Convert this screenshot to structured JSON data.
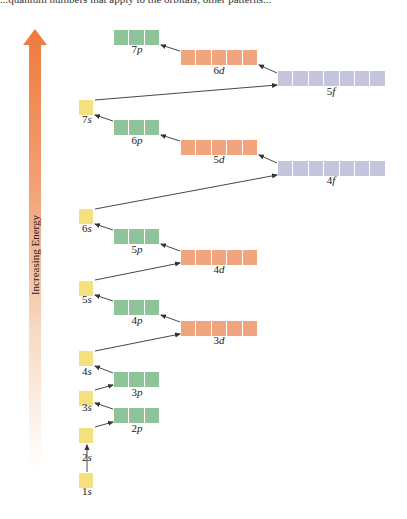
{
  "header": {
    "cutoff_text": "...quantum numbers that apply to the orbitals; other patterns..."
  },
  "axis": {
    "label": "Increasing Energy",
    "gradient_top": "#ee7a3c",
    "gradient_bottom": "#ffffff"
  },
  "colors": {
    "s": "#f4e07e",
    "p": "#8fc49b",
    "d": "#f2a47f",
    "f": "#c5c5dd",
    "arrow": "#333333"
  },
  "orbitals": [
    {
      "id": "1s",
      "n": "1",
      "l": "s",
      "boxes": 1,
      "x": 79,
      "y": 473,
      "label_x": 87,
      "label_y": 491
    },
    {
      "id": "2s",
      "n": "2",
      "l": "s",
      "boxes": 1,
      "x": 79,
      "y": 428,
      "label_x": 87,
      "label_y": 457
    },
    {
      "id": "2p",
      "n": "2",
      "l": "p",
      "boxes": 3,
      "x": 114,
      "y": 408,
      "label_x": 137,
      "label_y": 428
    },
    {
      "id": "3s",
      "n": "3",
      "l": "s",
      "boxes": 1,
      "x": 79,
      "y": 391,
      "label_x": 87,
      "label_y": 407
    },
    {
      "id": "3p",
      "n": "3",
      "l": "p",
      "boxes": 3,
      "x": 114,
      "y": 372,
      "label_x": 137,
      "label_y": 392
    },
    {
      "id": "4s",
      "n": "4",
      "l": "s",
      "boxes": 1,
      "x": 79,
      "y": 351,
      "label_x": 87,
      "label_y": 371
    },
    {
      "id": "3d",
      "n": "3",
      "l": "d",
      "boxes": 5,
      "x": 181,
      "y": 321,
      "label_x": 219,
      "label_y": 340
    },
    {
      "id": "4p",
      "n": "4",
      "l": "p",
      "boxes": 3,
      "x": 114,
      "y": 300,
      "label_x": 137,
      "label_y": 320
    },
    {
      "id": "5s",
      "n": "5",
      "l": "s",
      "boxes": 1,
      "x": 79,
      "y": 281,
      "label_x": 87,
      "label_y": 299
    },
    {
      "id": "4d",
      "n": "4",
      "l": "d",
      "boxes": 5,
      "x": 181,
      "y": 250,
      "label_x": 219,
      "label_y": 269
    },
    {
      "id": "5p",
      "n": "5",
      "l": "p",
      "boxes": 3,
      "x": 114,
      "y": 229,
      "label_x": 137,
      "label_y": 249
    },
    {
      "id": "6s",
      "n": "6",
      "l": "s",
      "boxes": 1,
      "x": 79,
      "y": 209,
      "label_x": 87,
      "label_y": 228
    },
    {
      "id": "4f",
      "n": "4",
      "l": "f",
      "boxes": 7,
      "x": 278,
      "y": 161,
      "label_x": 331,
      "label_y": 180
    },
    {
      "id": "5d",
      "n": "5",
      "l": "d",
      "boxes": 5,
      "x": 181,
      "y": 140,
      "label_x": 219,
      "label_y": 159
    },
    {
      "id": "6p",
      "n": "6",
      "l": "p",
      "boxes": 3,
      "x": 114,
      "y": 120,
      "label_x": 137,
      "label_y": 140
    },
    {
      "id": "7s",
      "n": "7",
      "l": "s",
      "boxes": 1,
      "x": 79,
      "y": 100,
      "label_x": 87,
      "label_y": 119
    },
    {
      "id": "5f",
      "n": "5",
      "l": "f",
      "boxes": 7,
      "x": 278,
      "y": 71,
      "label_x": 331,
      "label_y": 91
    },
    {
      "id": "6d",
      "n": "6",
      "l": "d",
      "boxes": 5,
      "x": 181,
      "y": 50,
      "label_x": 219,
      "label_y": 70
    },
    {
      "id": "7p",
      "n": "7",
      "l": "p",
      "boxes": 3,
      "x": 114,
      "y": 30,
      "label_x": 137,
      "label_y": 49
    }
  ],
  "filling_order": [
    "1s",
    "2s",
    "2p",
    "3s",
    "3p",
    "4s",
    "3d",
    "4p",
    "5s",
    "4d",
    "5p",
    "6s",
    "4f",
    "5d",
    "6p",
    "7s",
    "5f",
    "6d",
    "7p"
  ],
  "arrows": [
    {
      "from": "1s",
      "to": "2s",
      "x1": 87,
      "y1": 472,
      "x2": 87,
      "y2": 445
    },
    {
      "from": "2s",
      "to": "2p",
      "x1": 95,
      "y1": 427,
      "x2": 113,
      "y2": 422
    },
    {
      "from": "2p",
      "to": "3s",
      "x1": 113,
      "y1": 409,
      "x2": 95,
      "y2": 403
    },
    {
      "from": "3s",
      "to": "3p",
      "x1": 95,
      "y1": 390,
      "x2": 113,
      "y2": 385
    },
    {
      "from": "3p",
      "to": "4s",
      "x1": 113,
      "y1": 373,
      "x2": 95,
      "y2": 366
    },
    {
      "from": "4s",
      "to": "3d",
      "x1": 95,
      "y1": 351,
      "x2": 180,
      "y2": 334
    },
    {
      "from": "3d",
      "to": "4p",
      "x1": 180,
      "y1": 322,
      "x2": 161,
      "y2": 315
    },
    {
      "from": "4p",
      "to": "5s",
      "x1": 113,
      "y1": 301,
      "x2": 95,
      "y2": 295
    },
    {
      "from": "5s",
      "to": "4d",
      "x1": 95,
      "y1": 280,
      "x2": 180,
      "y2": 263
    },
    {
      "from": "4d",
      "to": "5p",
      "x1": 180,
      "y1": 251,
      "x2": 161,
      "y2": 244
    },
    {
      "from": "5p",
      "to": "6s",
      "x1": 113,
      "y1": 230,
      "x2": 95,
      "y2": 224
    },
    {
      "from": "6s",
      "to": "4f",
      "x1": 95,
      "y1": 209,
      "x2": 277,
      "y2": 175
    },
    {
      "from": "4f",
      "to": "5d",
      "x1": 277,
      "y1": 163,
      "x2": 259,
      "y2": 155
    },
    {
      "from": "5d",
      "to": "6p",
      "x1": 180,
      "y1": 141,
      "x2": 161,
      "y2": 135
    },
    {
      "from": "6p",
      "to": "7s",
      "x1": 113,
      "y1": 121,
      "x2": 95,
      "y2": 115
    },
    {
      "from": "7s",
      "to": "5f",
      "x1": 95,
      "y1": 100,
      "x2": 277,
      "y2": 85
    },
    {
      "from": "5f",
      "to": "6d",
      "x1": 277,
      "y1": 73,
      "x2": 259,
      "y2": 65
    },
    {
      "from": "6d",
      "to": "7p",
      "x1": 180,
      "y1": 51,
      "x2": 161,
      "y2": 45
    }
  ]
}
